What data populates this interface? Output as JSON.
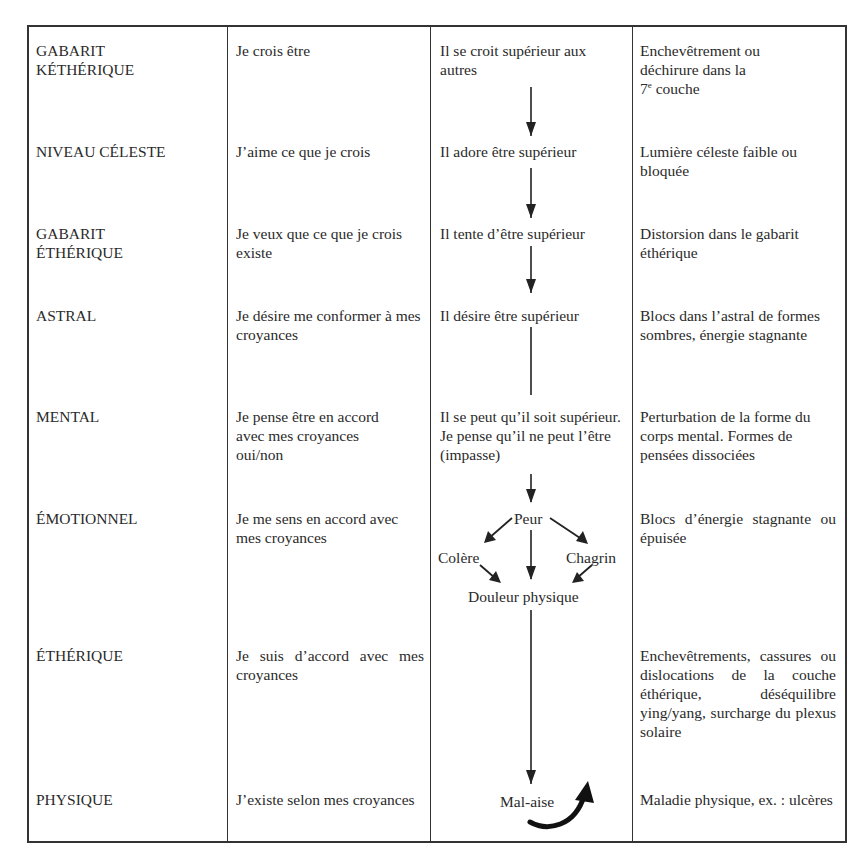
{
  "table": {
    "rows": [
      {
        "level": [
          "GABARIT",
          "KÉTHÉRIQUE"
        ],
        "belief": "Je crois être",
        "attitude": "Il se croit supérieur aux autres",
        "symptom_parts": [
          "Enchevêtrement ou",
          "déchirure dans la",
          "7",
          "e",
          " couche"
        ]
      },
      {
        "level": [
          "NIVEAU CÉLESTE"
        ],
        "belief": "J’aime ce que je crois",
        "attitude": "Il adore être supérieur",
        "symptom": "Lumière céleste faible ou bloquée"
      },
      {
        "level": [
          "GABARIT",
          "ÉTHÉRIQUE"
        ],
        "belief": "Je veux que ce que je crois existe",
        "attitude": "Il tente d’être supérieur",
        "symptom": "Distorsion dans le gabarit éthérique"
      },
      {
        "level": [
          "ASTRAL"
        ],
        "belief": "Je désire me conformer à mes croyances",
        "attitude": "Il désire être supérieur",
        "symptom": "Blocs dans l’astral de formes sombres, énergie stagnante"
      },
      {
        "level": [
          "MENTAL"
        ],
        "belief": "Je pense être en accord avec mes croyances oui/non",
        "attitude": "Il se peut qu’il soit supérieur. Je pense qu’il ne peut l’être (impasse)",
        "symptom": "Perturbation de la forme du corps mental. Formes de pensées dissociées"
      },
      {
        "level": [
          "ÉMOTIONNEL"
        ],
        "belief": "Je me sens en accord avec mes croyances",
        "attitude_flow": {
          "top": "Peur",
          "left": "Colère",
          "right": "Chagrin",
          "bottom": "Douleur physique"
        },
        "symptom": "Blocs d’énergie stagnante ou épuisée"
      },
      {
        "level": [
          "ÉTHÉRIQUE"
        ],
        "belief": "Je suis d’accord avec mes croyances",
        "attitude": "",
        "symptom": "Enchevêtrements, cassures ou dislocations de la couche éthérique, déséquilibre ying/yang, surcharge du plexus solaire"
      },
      {
        "level": [
          "PHYSIQUE"
        ],
        "belief": "J’existe selon mes croyances",
        "attitude": "Mal-aise",
        "symptom": "Maladie physique, ex. : ulcères"
      }
    ]
  },
  "icons": {
    "flow_arrows": "down-arrow",
    "return_arrow": "curved-up-arrow"
  }
}
